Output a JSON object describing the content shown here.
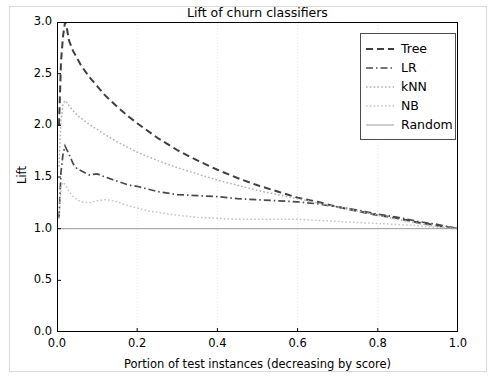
{
  "chart_data": {
    "type": "line",
    "title": "Lift of churn classifiers",
    "xlabel": "Portion of test instances (decreasing by score)",
    "ylabel": "Lift",
    "xlim": [
      0.0,
      1.0
    ],
    "ylim": [
      0.0,
      3.0
    ],
    "xticks": [
      "0.0",
      "0.2",
      "0.4",
      "0.6",
      "0.8",
      "1.0"
    ],
    "xtick_values": [
      0.0,
      0.2,
      0.4,
      0.6,
      0.8,
      1.0
    ],
    "yticks": [
      "0.0",
      "0.5",
      "1.0",
      "1.5",
      "2.0",
      "2.5",
      "3.0"
    ],
    "ytick_values": [
      0.0,
      0.5,
      1.0,
      1.5,
      2.0,
      2.5,
      3.0
    ],
    "grid": true,
    "grid_style": "dotted",
    "legend_position": "upper right",
    "series": [
      {
        "name": "Tree",
        "style": "dashed",
        "color": "#3f3f3f",
        "x": [
          0.005,
          0.01,
          0.015,
          0.02,
          0.025,
          0.03,
          0.04,
          0.05,
          0.06,
          0.08,
          0.1,
          0.12,
          0.15,
          0.18,
          0.2,
          0.25,
          0.3,
          0.35,
          0.4,
          0.45,
          0.5,
          0.55,
          0.6,
          0.65,
          0.7,
          0.75,
          0.8,
          0.85,
          0.9,
          0.95,
          1.0
        ],
        "y": [
          2.0,
          2.62,
          2.86,
          3.0,
          2.93,
          2.82,
          2.72,
          2.65,
          2.58,
          2.47,
          2.38,
          2.29,
          2.18,
          2.08,
          2.02,
          1.88,
          1.76,
          1.66,
          1.57,
          1.49,
          1.42,
          1.36,
          1.3,
          1.26,
          1.21,
          1.17,
          1.13,
          1.1,
          1.06,
          1.03,
          1.0
        ]
      },
      {
        "name": "LR",
        "style": "dashdot",
        "color": "#4a4a4a",
        "x": [
          0.005,
          0.01,
          0.015,
          0.02,
          0.03,
          0.04,
          0.05,
          0.06,
          0.08,
          0.1,
          0.12,
          0.15,
          0.18,
          0.2,
          0.25,
          0.3,
          0.35,
          0.4,
          0.45,
          0.5,
          0.55,
          0.6,
          0.65,
          0.7,
          0.75,
          0.8,
          0.85,
          0.9,
          0.95,
          1.0
        ],
        "y": [
          1.1,
          1.55,
          1.72,
          1.8,
          1.72,
          1.63,
          1.58,
          1.56,
          1.52,
          1.53,
          1.5,
          1.46,
          1.42,
          1.41,
          1.36,
          1.33,
          1.32,
          1.31,
          1.29,
          1.28,
          1.27,
          1.26,
          1.24,
          1.21,
          1.18,
          1.14,
          1.11,
          1.07,
          1.04,
          1.0
        ]
      },
      {
        "name": "kNN",
        "style": "dotted",
        "color": "#b0b0b0",
        "x": [
          0.005,
          0.01,
          0.015,
          0.02,
          0.025,
          0.03,
          0.04,
          0.05,
          0.06,
          0.08,
          0.1,
          0.12,
          0.15,
          0.18,
          0.2,
          0.25,
          0.3,
          0.35,
          0.4,
          0.45,
          0.5,
          0.55,
          0.6,
          0.65,
          0.7,
          0.75,
          0.8,
          0.85,
          0.9,
          0.95,
          1.0
        ],
        "y": [
          1.6,
          2.05,
          2.2,
          2.24,
          2.22,
          2.19,
          2.14,
          2.1,
          2.07,
          2.01,
          1.96,
          1.91,
          1.84,
          1.78,
          1.74,
          1.66,
          1.59,
          1.53,
          1.47,
          1.42,
          1.37,
          1.33,
          1.29,
          1.25,
          1.21,
          1.17,
          1.13,
          1.09,
          1.05,
          1.02,
          1.0
        ]
      },
      {
        "name": "NB",
        "style": "dotted",
        "color": "#c4c4c4",
        "x": [
          0.005,
          0.01,
          0.015,
          0.02,
          0.03,
          0.04,
          0.05,
          0.06,
          0.08,
          0.1,
          0.12,
          0.14,
          0.15,
          0.17,
          0.2,
          0.23,
          0.25,
          0.3,
          0.35,
          0.4,
          0.45,
          0.5,
          0.55,
          0.6,
          0.65,
          0.7,
          0.75,
          0.8,
          0.85,
          0.9,
          0.95,
          1.0
        ],
        "y": [
          1.1,
          1.4,
          1.45,
          1.43,
          1.36,
          1.31,
          1.28,
          1.26,
          1.25,
          1.27,
          1.28,
          1.27,
          1.26,
          1.23,
          1.2,
          1.17,
          1.16,
          1.13,
          1.11,
          1.1,
          1.09,
          1.09,
          1.09,
          1.09,
          1.08,
          1.07,
          1.06,
          1.05,
          1.04,
          1.03,
          1.01,
          1.0
        ]
      },
      {
        "name": "Random",
        "style": "solid",
        "color": "#9a9a9a",
        "x": [
          0.0,
          1.0
        ],
        "y": [
          1.0,
          1.0
        ]
      }
    ]
  },
  "legend": {
    "items": [
      {
        "label": "Tree"
      },
      {
        "label": "LR"
      },
      {
        "label": "kNN"
      },
      {
        "label": "NB"
      },
      {
        "label": "Random"
      }
    ]
  },
  "colors": {
    "axis": "#000000",
    "grid": "#e8e8e8",
    "figure_border": "#d9d9d9",
    "background": "#ffffff"
  }
}
